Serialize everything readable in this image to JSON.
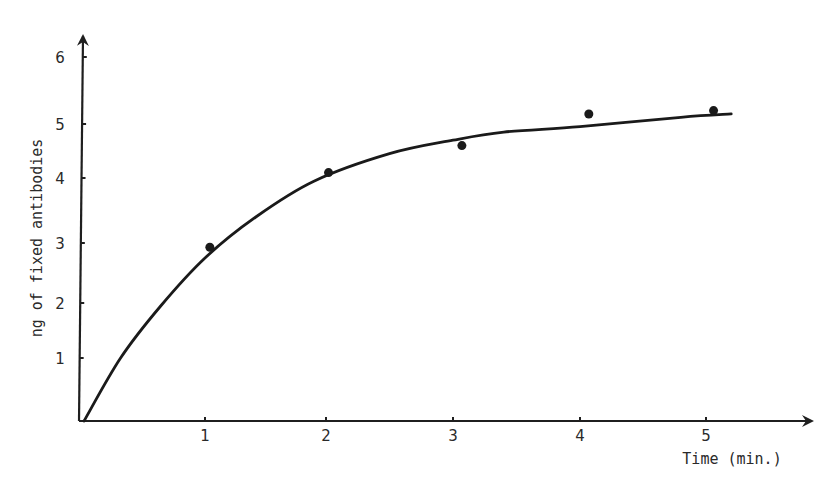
{
  "chart_data": {
    "type": "scatter",
    "title": "",
    "xlabel": "Time (min.)",
    "ylabel": "ng of fixed antibodies",
    "xlim": [
      0,
      5.5
    ],
    "ylim": [
      0,
      6
    ],
    "x_ticks": [
      "1",
      "2",
      "3",
      "4",
      "5"
    ],
    "y_ticks": [
      "1",
      "2",
      "3",
      "4",
      "5",
      "6"
    ],
    "grid": false,
    "legend": null,
    "series": [
      {
        "name": "measured",
        "kind": "points",
        "x": [
          1.04,
          2.02,
          3.07,
          4.07,
          5.06
        ],
        "y": [
          2.93,
          4.1,
          4.6,
          5.15,
          5.2
        ]
      },
      {
        "name": "fitted curve",
        "kind": "line",
        "x": [
          0.04,
          0.33,
          0.65,
          1.0,
          1.42,
          1.9,
          2.5,
          3.0,
          3.4,
          4.0,
          4.8,
          5.2
        ],
        "y": [
          0.0,
          1.0,
          1.95,
          2.75,
          3.4,
          3.95,
          4.45,
          4.7,
          4.85,
          4.95,
          5.1,
          5.15
        ]
      }
    ]
  }
}
